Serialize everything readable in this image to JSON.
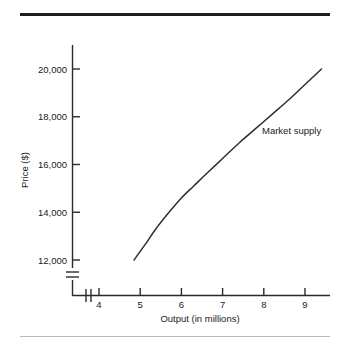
{
  "figure": {
    "top_rule_color": "#1d1d1d",
    "bottom_rule_color": "#b9b9b9",
    "background": "#ffffff"
  },
  "chart_data": {
    "type": "line",
    "title": "",
    "xlabel": "Output (in millions)",
    "ylabel": "Price ($)",
    "xlim": [
      3.4,
      9.6
    ],
    "ylim": [
      11200,
      21000
    ],
    "grid": false,
    "legend_position": "inline-right",
    "axis_break": {
      "x_axis": true,
      "y_axis": true,
      "note": "double-slash break marks near the origin on both axes"
    },
    "xticks": [
      4,
      5,
      6,
      7,
      8,
      9
    ],
    "xticklabels": [
      "4",
      "5",
      "6",
      "7",
      "8",
      "9"
    ],
    "yticks": [
      12000,
      14000,
      16000,
      18000,
      20000
    ],
    "yticklabels": [
      "12,000",
      "14,000",
      "16,000",
      "18,000",
      "20,000"
    ],
    "series": [
      {
        "name": "Market supply",
        "color": "#2f2f2f",
        "annotation": "Market supply",
        "x": [
          4.85,
          5.1,
          5.4,
          5.7,
          6.0,
          6.3,
          6.6,
          7.0,
          7.4,
          7.8,
          8.2,
          8.6,
          9.0,
          9.4
        ],
        "y": [
          12000,
          12600,
          13350,
          14000,
          14600,
          15100,
          15600,
          16250,
          16900,
          17500,
          18100,
          18700,
          19350,
          20000
        ]
      }
    ]
  }
}
